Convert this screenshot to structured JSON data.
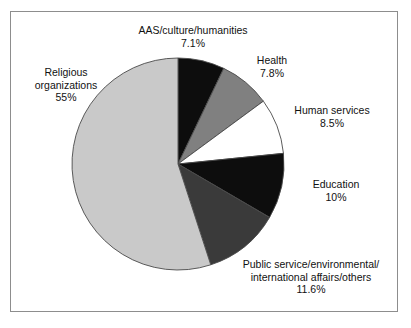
{
  "figure": {
    "background_color": "#ffffff",
    "frame_color": "#8d8d8d"
  },
  "chart_data": {
    "type": "pie",
    "title": "",
    "subtitle": "",
    "xlabel": "",
    "ylabel": "",
    "legend_position": "none",
    "grid": false,
    "units": "percent",
    "start_angle_deg": 90,
    "direction": "clockwise",
    "categories": [
      "AAS/culture/humanities",
      "Health",
      "Human services",
      "Education",
      "Public service/environmental/international affairs/others",
      "Religious organizations"
    ],
    "values": [
      7.1,
      7.8,
      8.5,
      10,
      11.6,
      55
    ],
    "colors": [
      "#0d0d0d",
      "#808080",
      "#ffffff",
      "#0d0d0d",
      "#3a3a3a",
      "#c9c9c9"
    ],
    "slices": [
      {
        "name": "AAS/culture/humanities",
        "value": 7.1,
        "value_label": "7.1%",
        "color": "#0d0d0d",
        "label_lines": [
          "AAS/culture/humanities",
          "7.1%"
        ]
      },
      {
        "name": "Health",
        "value": 7.8,
        "value_label": "7.8%",
        "color": "#808080",
        "label_lines": [
          "Health",
          "7.8%"
        ]
      },
      {
        "name": "Human services",
        "value": 8.5,
        "value_label": "8.5%",
        "color": "#ffffff",
        "label_lines": [
          "Human services",
          "8.5%"
        ]
      },
      {
        "name": "Education",
        "value": 10,
        "value_label": "10%",
        "color": "#0d0d0d",
        "label_lines": [
          "Education",
          "10%"
        ]
      },
      {
        "name": "Public service/environmental/international affairs/others",
        "value": 11.6,
        "value_label": "11.6%",
        "color": "#3a3a3a",
        "label_lines": [
          "Public service/environmental/",
          "international affairs/others",
          "11.6%"
        ]
      },
      {
        "name": "Religious organizations",
        "value": 55,
        "value_label": "55%",
        "color": "#c9c9c9",
        "label_lines": [
          "Religious",
          "organizations",
          "55%"
        ]
      }
    ],
    "geometry": {
      "center_x": 178,
      "center_y": 164,
      "radius": 106
    }
  },
  "labels": {
    "aas": {
      "line1": "AAS/culture/humanities",
      "line2": "7.1%"
    },
    "health": {
      "line1": "Health",
      "line2": "7.8%"
    },
    "human_services": {
      "line1": "Human services",
      "line2": "8.5%"
    },
    "education": {
      "line1": "Education",
      "line2": "10%"
    },
    "public_service": {
      "line1": "Public service/environmental/",
      "line2": "international affairs/others",
      "line3": "11.6%"
    },
    "religious": {
      "line1": "Religious",
      "line2": "organizations",
      "line3": "55%"
    }
  }
}
